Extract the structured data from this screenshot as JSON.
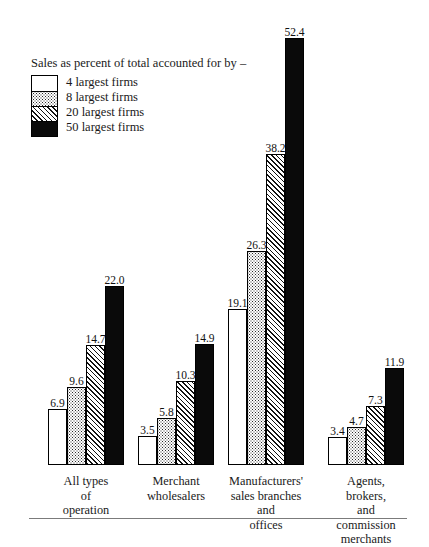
{
  "legend": {
    "title": "Sales as percent of total accounted for by –",
    "entries": [
      {
        "label": "4 largest firms",
        "pattern": "white"
      },
      {
        "label": "8 largest firms",
        "pattern": "stipple"
      },
      {
        "label": "20 largest firms",
        "pattern": "hatch"
      },
      {
        "label": "50 largest firms",
        "pattern": "solid"
      }
    ]
  },
  "chart_data": {
    "type": "bar",
    "title": "Sales as percent of total accounted for by –",
    "xlabel": "",
    "ylabel": "",
    "ylim": [
      0,
      52.4
    ],
    "grid": false,
    "legend_position": "top-left",
    "categories": [
      "All types of\noperation",
      "Merchant\nwholesalers",
      "Manufacturers'\nsales branches and\noffices",
      "Agents, brokers,\nand commission\nmerchants"
    ],
    "series": [
      {
        "name": "4 largest firms",
        "values": [
          6.9,
          3.5,
          19.1,
          3.4
        ]
      },
      {
        "name": "8 largest firms",
        "values": [
          9.6,
          5.8,
          26.3,
          4.7
        ]
      },
      {
        "name": "20 largest firms",
        "values": [
          14.7,
          10.3,
          38.2,
          7.3
        ]
      },
      {
        "name": "50 largest firms",
        "values": [
          11.9,
          14.9,
          52.4,
          11.9
        ]
      }
    ],
    "groups": [
      {
        "category": "All types of\noperation",
        "left": 48,
        "bars": [
          {
            "series": "4 largest firms",
            "value": 6.9,
            "label": "6.9",
            "pattern": "white"
          },
          {
            "series": "8 largest firms",
            "value": 9.6,
            "label": "9.6",
            "pattern": "stipple"
          },
          {
            "series": "20 largest firms",
            "value": 14.7,
            "label": "14.7",
            "pattern": "hatch"
          },
          {
            "series": "50 largest firms",
            "value": 22.0,
            "label": "22.0",
            "pattern": "solid"
          }
        ]
      },
      {
        "category": "Merchant\nwholesalers",
        "left": 138,
        "bars": [
          {
            "series": "4 largest firms",
            "value": 3.5,
            "label": "3.5",
            "pattern": "white"
          },
          {
            "series": "8 largest firms",
            "value": 5.8,
            "label": "5.8",
            "pattern": "stipple"
          },
          {
            "series": "20 largest firms",
            "value": 10.3,
            "label": "10.3",
            "pattern": "hatch"
          },
          {
            "series": "50 largest firms",
            "value": 14.9,
            "label": "14.9",
            "pattern": "solid"
          }
        ]
      },
      {
        "category": "Manufacturers'\nsales branches and\noffices",
        "left": 228,
        "bars": [
          {
            "series": "4 largest firms",
            "value": 19.1,
            "label": "19.1",
            "pattern": "white"
          },
          {
            "series": "8 largest firms",
            "value": 26.3,
            "label": "26.3",
            "pattern": "stipple"
          },
          {
            "series": "20 largest firms",
            "value": 38.2,
            "label": "38.2",
            "pattern": "hatch"
          },
          {
            "series": "50 largest firms",
            "value": 52.4,
            "label": "52.4",
            "pattern": "solid"
          }
        ]
      },
      {
        "category": "Agents, brokers,\nand commission\nmerchants",
        "left": 328,
        "bars": [
          {
            "series": "4 largest firms",
            "value": 3.4,
            "label": "3.4",
            "pattern": "white"
          },
          {
            "series": "8 largest firms",
            "value": 4.7,
            "label": "4.7",
            "pattern": "stipple"
          },
          {
            "series": "20 largest firms",
            "value": 7.3,
            "label": "7.3",
            "pattern": "hatch"
          },
          {
            "series": "50 largest firms",
            "value": 11.9,
            "label": "11.9",
            "pattern": "solid"
          }
        ]
      }
    ]
  },
  "scale": {
    "px_per_unit": 8.15
  }
}
